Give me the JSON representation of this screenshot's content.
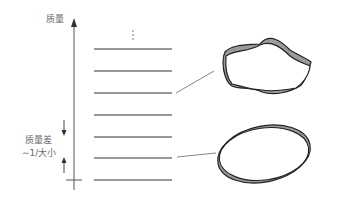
{
  "diagram": {
    "axis_label_top": "质量",
    "gap_label_line1": "质量差",
    "gap_label_line2": "∼1/大小",
    "ellipsis": "⋮",
    "levels_count": 7,
    "shapes": [
      {
        "name": "high-mode-deformed-ring",
        "connected_level": 3
      },
      {
        "name": "low-mode-elliptic-ring",
        "connected_level": 6
      }
    ],
    "colors": {
      "axis": "#555555",
      "level_line": "#333333",
      "ring_fill": "#9a9a9a",
      "ring_stroke": "#222222",
      "text": "#6a6a6a"
    }
  }
}
